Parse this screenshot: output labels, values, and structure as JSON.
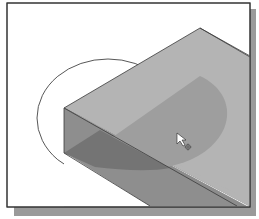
{
  "figure": {
    "colors": {
      "background": "#ffffff",
      "frame_border": "#333333",
      "frame_shadow": "#9a9a9a",
      "top_face": "#b4b4b4",
      "front_face": "#8c8c8c",
      "half_disc_top": "#9e9e9e",
      "half_disc_front": "#747474",
      "edge": "#3a3a3a"
    },
    "cursor": {
      "type": "select-arrow-with-crosshair"
    }
  }
}
